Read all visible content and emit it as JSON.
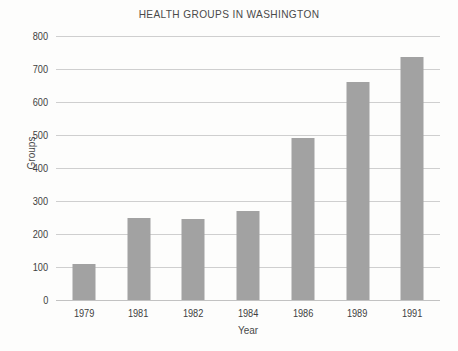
{
  "chart_data": {
    "type": "bar",
    "title": "HEALTH GROUPS IN WASHINGTON",
    "xlabel": "Year",
    "ylabel": "Groups",
    "categories": [
      "1979",
      "1981",
      "1982",
      "1984",
      "1986",
      "1989",
      "1991"
    ],
    "values": [
      110,
      248,
      247,
      270,
      492,
      660,
      735
    ],
    "ylim": [
      0,
      800
    ],
    "ytick_step": 100,
    "yticks": [
      "800",
      "700",
      "600",
      "500",
      "400",
      "300",
      "200",
      "100",
      "0"
    ],
    "grid": true,
    "legend": "none",
    "colors": {
      "bar": "#a2a2a2",
      "gridline": "#cfcfcf",
      "background": "#fdfdfc",
      "text": "#3f3f3f",
      "title_text": "#4a4a4a"
    }
  }
}
